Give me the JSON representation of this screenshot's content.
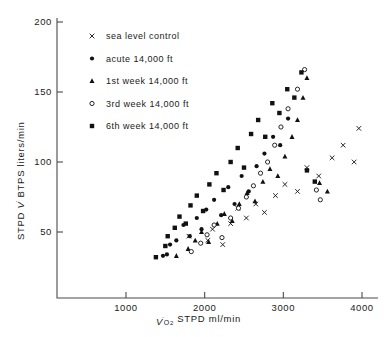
{
  "chart_data": {
    "type": "scatter",
    "title": "",
    "xlabel": "V̇O2 STPD ml/min",
    "ylabel": "STPD V̇ BTPS liters/min",
    "xlim": [
      500,
      4300
    ],
    "ylim": [
      20,
      205
    ],
    "xticks": [
      1000,
      2000,
      3000,
      4000
    ],
    "xtick_labels": [
      "1000",
      "2000",
      "3000",
      "4000"
    ],
    "yticks": [
      50,
      100,
      150,
      200
    ],
    "ytick_labels": [
      "50",
      "100",
      "150",
      "200"
    ],
    "grid": false,
    "legend_position": "upper-center-right",
    "series": [
      {
        "name": "sea level control",
        "marker": "x",
        "points": [
          [
            1800,
            47
          ],
          [
            2040,
            44
          ],
          [
            2100,
            52
          ],
          [
            2230,
            41
          ],
          [
            2330,
            56
          ],
          [
            2420,
            67
          ],
          [
            2530,
            60
          ],
          [
            2650,
            70
          ],
          [
            2760,
            64
          ],
          [
            2900,
            76
          ],
          [
            3020,
            84
          ],
          [
            3180,
            79
          ],
          [
            3300,
            96
          ],
          [
            3450,
            90
          ],
          [
            3620,
            103
          ],
          [
            3760,
            112
          ],
          [
            3900,
            100
          ],
          [
            3960,
            124
          ]
        ]
      },
      {
        "name": "acute 14,000 ft",
        "marker": "filled-circle",
        "points": [
          [
            1470,
            33
          ],
          [
            1520,
            34
          ],
          [
            1560,
            41
          ],
          [
            1640,
            44
          ],
          [
            1730,
            55
          ],
          [
            1810,
            47
          ],
          [
            1900,
            60
          ],
          [
            1960,
            52
          ],
          [
            2020,
            66
          ],
          [
            2120,
            73
          ],
          [
            2210,
            62
          ],
          [
            2300,
            82
          ],
          [
            2380,
            70
          ],
          [
            2470,
            90
          ],
          [
            2560,
            79
          ],
          [
            2660,
            97
          ],
          [
            2760,
            106
          ],
          [
            2870,
            118
          ],
          [
            2960,
            112
          ],
          [
            3060,
            131
          ]
        ]
      },
      {
        "name": "1st week 14,000 ft",
        "marker": "filled-triangle",
        "points": [
          [
            1640,
            33
          ],
          [
            1790,
            38
          ],
          [
            1880,
            44
          ],
          [
            1960,
            50
          ],
          [
            2050,
            43
          ],
          [
            2160,
            56
          ],
          [
            2250,
            63
          ],
          [
            2350,
            58
          ],
          [
            2440,
            70
          ],
          [
            2540,
            78
          ],
          [
            2640,
            72
          ],
          [
            2740,
            86
          ],
          [
            2830,
            95
          ],
          [
            2930,
            90
          ],
          [
            3020,
            104
          ],
          [
            3110,
            118
          ],
          [
            3180,
            130
          ],
          [
            3250,
            146
          ],
          [
            3300,
            160
          ],
          [
            3460,
            85
          ],
          [
            3560,
            79
          ]
        ]
      },
      {
        "name": "3rd week 14,000 ft",
        "marker": "open-circle",
        "points": [
          [
            1830,
            36
          ],
          [
            1950,
            42
          ],
          [
            2030,
            48
          ],
          [
            2120,
            55
          ],
          [
            2220,
            46
          ],
          [
            2330,
            60
          ],
          [
            2430,
            67
          ],
          [
            2530,
            75
          ],
          [
            2620,
            83
          ],
          [
            2710,
            92
          ],
          [
            2800,
            100
          ],
          [
            2890,
            112
          ],
          [
            2970,
            125
          ],
          [
            3060,
            138
          ],
          [
            3180,
            152
          ],
          [
            3270,
            166
          ],
          [
            3420,
            80
          ],
          [
            3470,
            73
          ]
        ]
      },
      {
        "name": "6th week 14,000 ft",
        "marker": "filled-square",
        "points": [
          [
            1380,
            32
          ],
          [
            1500,
            40
          ],
          [
            1530,
            47
          ],
          [
            1620,
            53
          ],
          [
            1680,
            61
          ],
          [
            1760,
            56
          ],
          [
            1820,
            69
          ],
          [
            1900,
            76
          ],
          [
            1980,
            65
          ],
          [
            2060,
            84
          ],
          [
            2150,
            92
          ],
          [
            2240,
            80
          ],
          [
            2330,
            100
          ],
          [
            2420,
            110
          ],
          [
            2500,
            96
          ],
          [
            2590,
            120
          ],
          [
            2680,
            130
          ],
          [
            2770,
            118
          ],
          [
            2860,
            142
          ],
          [
            2950,
            135
          ],
          [
            3050,
            152
          ],
          [
            3140,
            146
          ],
          [
            3230,
            164
          ],
          [
            3400,
            86
          ],
          [
            3300,
            94
          ]
        ]
      }
    ]
  },
  "legend": {
    "items": [
      {
        "marker": "x",
        "label": "sea level control"
      },
      {
        "marker": "filled-circle",
        "label": "acute 14,000 ft"
      },
      {
        "marker": "filled-triangle",
        "label": "1st week 14,000 ft"
      },
      {
        "marker": "open-circle",
        "label": "3rd week 14,000 ft"
      },
      {
        "marker": "filled-square",
        "label": "6th week 14,000 ft"
      }
    ]
  },
  "colors": {
    "marker": "#111111",
    "axis": "#4a4a4a",
    "background": "#ffffff"
  }
}
